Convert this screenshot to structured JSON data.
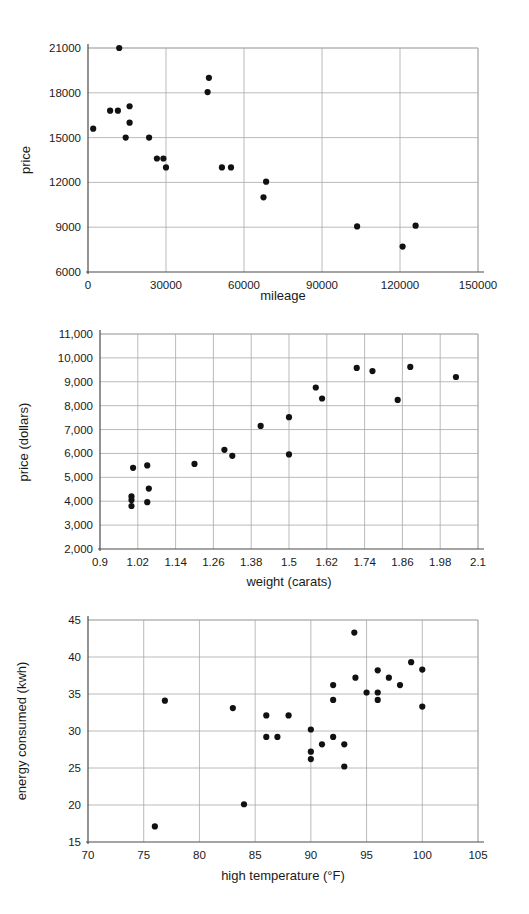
{
  "page": {
    "background": "#ffffff",
    "point_color": "#111111",
    "grid_color": "#a8a8a8",
    "axis_color": "#4a4a4a"
  },
  "chart_data": [
    {
      "id": "car-price-vs-mileage",
      "type": "scatter",
      "title": "",
      "xlabel": "mileage",
      "ylabel": "price",
      "xlim": [
        0,
        150000
      ],
      "ylim": [
        6000,
        21000
      ],
      "xticks": [
        0,
        30000,
        60000,
        90000,
        120000,
        150000
      ],
      "yticks": [
        6000,
        9000,
        12000,
        15000,
        18000,
        21000
      ],
      "xtick_labels": [
        "0",
        "30000",
        "60000",
        "90000",
        "120000",
        "150000"
      ],
      "ytick_labels": [
        "6000",
        "9000",
        "12000",
        "15000",
        "18000",
        "21000"
      ],
      "grid": true,
      "legend": "none",
      "points": [
        [
          2000,
          15600
        ],
        [
          12000,
          21000
        ],
        [
          8500,
          16800
        ],
        [
          11500,
          16800
        ],
        [
          16000,
          17100
        ],
        [
          16000,
          16000
        ],
        [
          14500,
          15000
        ],
        [
          23500,
          15000
        ],
        [
          26500,
          13600
        ],
        [
          29000,
          13600
        ],
        [
          30000,
          13000
        ],
        [
          46500,
          19000
        ],
        [
          46000,
          18050
        ],
        [
          51500,
          13000
        ],
        [
          55000,
          13000
        ],
        [
          68500,
          12050
        ],
        [
          67500,
          11000
        ],
        [
          103500,
          9050
        ],
        [
          126000,
          9100
        ],
        [
          121000,
          7700
        ]
      ]
    },
    {
      "id": "diamond-price-vs-weight",
      "type": "scatter",
      "title": "",
      "xlabel": "weight (carats)",
      "ylabel": "price (dollars)",
      "xlim": [
        0.9,
        2.1
      ],
      "ylim": [
        2000,
        11000
      ],
      "xticks": [
        0.9,
        1.02,
        1.14,
        1.26,
        1.38,
        1.5,
        1.62,
        1.74,
        1.86,
        1.98,
        2.1
      ],
      "yticks": [
        2000,
        3000,
        4000,
        5000,
        6000,
        7000,
        8000,
        9000,
        10000,
        11000
      ],
      "xtick_labels": [
        "0.9",
        "1.02",
        "1.14",
        "1.26",
        "1.38",
        "1.5",
        "1.62",
        "1.74",
        "1.86",
        "1.98",
        "2.1"
      ],
      "ytick_labels": [
        "2,000",
        "3,000",
        "4,000",
        "5,000",
        "6,000",
        "7,000",
        "8,000",
        "9,000",
        "10,000",
        "11,000"
      ],
      "grid": true,
      "legend": "none",
      "points": [
        [
          1.005,
          5400
        ],
        [
          1.0,
          4200
        ],
        [
          1.0,
          4050
        ],
        [
          1.0,
          3800
        ],
        [
          1.05,
          5500
        ],
        [
          1.055,
          4530
        ],
        [
          1.05,
          3960
        ],
        [
          1.2,
          5560
        ],
        [
          1.295,
          6150
        ],
        [
          1.32,
          5900
        ],
        [
          1.41,
          7150
        ],
        [
          1.5,
          7520
        ],
        [
          1.5,
          5960
        ],
        [
          1.585,
          8760
        ],
        [
          1.605,
          8300
        ],
        [
          1.715,
          9580
        ],
        [
          1.765,
          9450
        ],
        [
          1.845,
          8240
        ],
        [
          1.885,
          9620
        ],
        [
          2.03,
          9200
        ]
      ]
    },
    {
      "id": "energy-vs-temperature",
      "type": "scatter",
      "title": "",
      "xlabel": "high temperature (°F)",
      "ylabel": "energy consumed (kwh)",
      "xlim": [
        70,
        105
      ],
      "ylim": [
        15,
        45
      ],
      "xticks": [
        70,
        75,
        80,
        85,
        90,
        95,
        100,
        105
      ],
      "yticks": [
        15,
        20,
        25,
        30,
        35,
        40,
        45
      ],
      "xtick_labels": [
        "70",
        "75",
        "80",
        "85",
        "90",
        "95",
        "100",
        "105"
      ],
      "ytick_labels": [
        "15",
        "20",
        "25",
        "30",
        "35",
        "40",
        "45"
      ],
      "grid": true,
      "legend": "none",
      "points": [
        [
          76.0,
          17.1
        ],
        [
          76.9,
          34.1
        ],
        [
          83.0,
          33.1
        ],
        [
          84.0,
          20.1
        ],
        [
          86.0,
          32.1
        ],
        [
          86.0,
          29.2
        ],
        [
          87.0,
          29.2
        ],
        [
          88.0,
          32.1
        ],
        [
          90.0,
          30.2
        ],
        [
          90.0,
          27.2
        ],
        [
          90.0,
          26.2
        ],
        [
          91.0,
          28.2
        ],
        [
          92.0,
          36.2
        ],
        [
          92.0,
          34.2
        ],
        [
          92.0,
          29.2
        ],
        [
          93.0,
          28.2
        ],
        [
          93.0,
          25.2
        ],
        [
          93.9,
          43.3
        ],
        [
          94.0,
          37.2
        ],
        [
          95.0,
          35.2
        ],
        [
          96.0,
          38.2
        ],
        [
          96.0,
          35.2
        ],
        [
          96.0,
          34.2
        ],
        [
          97.0,
          37.2
        ],
        [
          98.0,
          36.2
        ],
        [
          99.0,
          39.3
        ],
        [
          100.0,
          38.3
        ],
        [
          100.0,
          33.3
        ]
      ]
    }
  ]
}
